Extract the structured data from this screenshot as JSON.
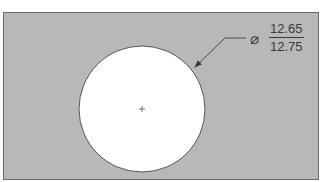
{
  "diagram": {
    "type": "engineering-drawing",
    "colors": {
      "plate_fill": "#b8b8b8",
      "plate_border": "#6a6a6a",
      "hole_fill": "#ffffff",
      "line": "#4a4a4a",
      "text": "#3a3a3a"
    },
    "dimension": {
      "symbol": "⌀",
      "symbol_name": "diameter",
      "upper_limit": "12.65",
      "lower_limit": "12.75"
    },
    "center_mark": "+"
  }
}
